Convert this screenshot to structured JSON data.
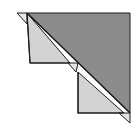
{
  "diagram": {
    "colors": {
      "background": "#ffffff",
      "dark_fill": "#8c8c8c",
      "light_fill": "#d3d3d3",
      "stroke": "#1a1a1a"
    },
    "shapes": {
      "dark_triangle": "27,13 130,13 130,113",
      "upper_light_quad": "27,13 30,63 78,63 78,63",
      "upper_light_triangle": "27,13 30,63 70,63",
      "lower_light_triangle": "78,72 78,113 124,113",
      "top_left_flap": "17,13 27,13 27,24",
      "middle_flap": "68,63 78,63 76,72",
      "bottom_right_flap": "119,113 130,113 130,123",
      "hypotenuse": "27,13 130,113"
    }
  }
}
